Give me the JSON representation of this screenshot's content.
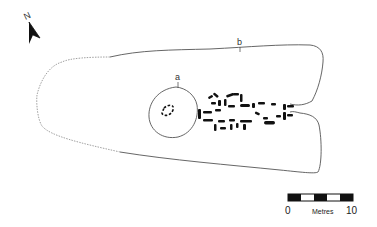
{
  "figure": {
    "type": "archaeological site plan",
    "north_arrow": {
      "label": "N"
    },
    "labels": {
      "a": "a",
      "b": "b"
    },
    "scale_bar": {
      "start": "0",
      "end": "10",
      "unit": "Metres",
      "segments": 5
    },
    "colors": {
      "outline": "#555555",
      "stones": "#111111",
      "background": "#ffffff"
    }
  }
}
